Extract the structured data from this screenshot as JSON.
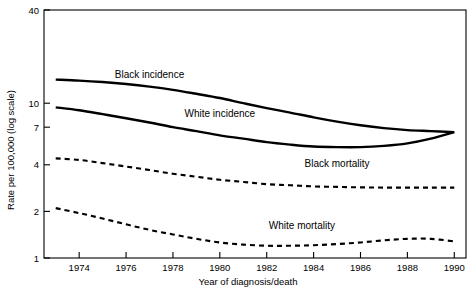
{
  "chart_data": {
    "type": "line",
    "title": "",
    "xlabel": "Year of diagnosis/death",
    "ylabel": "Rate per 100,000 (log scale)",
    "xlim": [
      1972.5,
      1990.5
    ],
    "ylim": [
      1,
      40
    ],
    "yscale": "log",
    "grid": false,
    "legend": "inline-annotations",
    "xticks": [
      "1974",
      "1976",
      "1978",
      "1980",
      "1982",
      "1984",
      "1986",
      "1988",
      "1990"
    ],
    "xtick_values": [
      1974,
      1976,
      1978,
      1980,
      1982,
      1984,
      1986,
      1988,
      1990
    ],
    "yticks": [
      "1",
      "2",
      "4",
      "7",
      "10",
      "40"
    ],
    "ytick_values": [
      1,
      2,
      4,
      7,
      10,
      40
    ],
    "x": [
      1973,
      1974,
      1975,
      1976,
      1977,
      1978,
      1979,
      1980,
      1981,
      1982,
      1983,
      1984,
      1985,
      1986,
      1987,
      1988,
      1989,
      1990
    ],
    "series": [
      {
        "name": "Black incidence",
        "style": "solid",
        "label_x": 1977.0,
        "label_y": 14.5,
        "values": [
          14.2,
          14.0,
          13.7,
          13.3,
          12.8,
          12.2,
          11.5,
          10.8,
          10.0,
          9.3,
          8.7,
          8.1,
          7.6,
          7.2,
          6.9,
          6.7,
          6.6,
          6.5
        ]
      },
      {
        "name": "White incidence",
        "style": "solid",
        "label_x": 1980.0,
        "label_y": 8.2,
        "values": [
          9.4,
          9.0,
          8.5,
          8.0,
          7.5,
          7.0,
          6.6,
          6.2,
          5.9,
          5.6,
          5.4,
          5.25,
          5.2,
          5.2,
          5.3,
          5.5,
          5.9,
          6.5
        ]
      },
      {
        "name": "Black mortality",
        "style": "dashed",
        "label_x": 1985.0,
        "label_y": 3.9,
        "values": [
          4.4,
          4.3,
          4.1,
          3.9,
          3.7,
          3.5,
          3.35,
          3.2,
          3.1,
          3.0,
          2.95,
          2.9,
          2.88,
          2.86,
          2.85,
          2.85,
          2.85,
          2.85
        ]
      },
      {
        "name": "White mortality",
        "style": "dashed",
        "label_x": 1983.5,
        "label_y": 1.55,
        "values": [
          2.1,
          1.95,
          1.8,
          1.65,
          1.52,
          1.42,
          1.33,
          1.26,
          1.22,
          1.2,
          1.2,
          1.21,
          1.23,
          1.26,
          1.3,
          1.33,
          1.33,
          1.28
        ]
      }
    ]
  },
  "colors": {
    "line": "#000000",
    "axis": "#000000",
    "background": "#ffffff"
  }
}
